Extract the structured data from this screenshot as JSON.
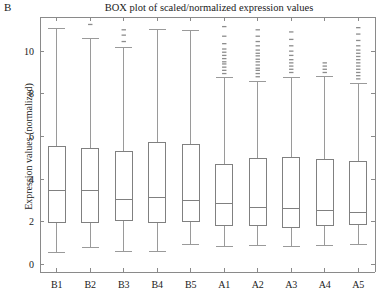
{
  "panel": {
    "label": "B"
  },
  "chart_data": {
    "type": "box",
    "title": "BOX plot of scaled/normalized expression values",
    "xlabel": "",
    "ylabel": "Expression values (normalized)",
    "categories": [
      "B1",
      "B2",
      "B3",
      "B4",
      "B5",
      "A1",
      "A2",
      "A3",
      "A4",
      "A5"
    ],
    "ylim": [
      -0.35,
      11.6
    ],
    "yticks": [
      0,
      2,
      4,
      6,
      8,
      10
    ],
    "ytick_labels": [
      "0",
      "2",
      "4",
      "6",
      "8",
      "10"
    ],
    "grid": false,
    "legend": null,
    "box_color": "#808080",
    "median_color": "#808080",
    "whisker_color": "#9a9a9a",
    "outlier_color": "#8c8c8c",
    "axis_color": "#8a8a8a",
    "boxes": [
      {
        "label": "B1",
        "whisker_low": 0.58,
        "q1": 1.95,
        "median": 3.45,
        "q3": 5.55,
        "whisker_high": 11.05,
        "outliers": []
      },
      {
        "label": "B2",
        "whisker_low": 0.82,
        "q1": 1.98,
        "median": 3.45,
        "q3": 5.42,
        "whisker_high": 10.6,
        "outliers": [
          11.25
        ]
      },
      {
        "label": "B3",
        "whisker_low": 0.6,
        "q1": 2.05,
        "median": 3.05,
        "q3": 5.3,
        "whisker_high": 10.15,
        "outliers": [
          10.45,
          10.75,
          11.0
        ]
      },
      {
        "label": "B4",
        "whisker_low": 0.62,
        "q1": 1.98,
        "median": 3.15,
        "q3": 5.72,
        "whisker_high": 11.0,
        "outliers": []
      },
      {
        "label": "B5",
        "whisker_low": 0.95,
        "q1": 2.02,
        "median": 2.98,
        "q3": 5.62,
        "whisker_high": 10.95,
        "outliers": []
      },
      {
        "label": "A1",
        "whisker_low": 0.85,
        "q1": 1.85,
        "median": 2.85,
        "q3": 4.7,
        "whisker_high": 8.75,
        "outliers": [
          8.95,
          9.1,
          9.25,
          9.4,
          9.5,
          9.65,
          9.8,
          9.95,
          10.1,
          10.35,
          10.7,
          11.15
        ]
      },
      {
        "label": "A2",
        "whisker_low": 0.88,
        "q1": 1.82,
        "median": 2.68,
        "q3": 4.98,
        "whisker_high": 8.6,
        "outliers": [
          8.8,
          8.95,
          9.1,
          9.2,
          9.35,
          9.5,
          9.62,
          9.78,
          9.9,
          10.05,
          10.25,
          10.45,
          10.7,
          11.0
        ]
      },
      {
        "label": "A3",
        "whisker_low": 0.85,
        "q1": 1.75,
        "median": 2.62,
        "q3": 5.02,
        "whisker_high": 8.75,
        "outliers": [
          9.0,
          9.15,
          9.3,
          9.45,
          9.6,
          9.8,
          10.0,
          10.25,
          10.55,
          10.9
        ]
      },
      {
        "label": "A4",
        "whisker_low": 0.9,
        "q1": 1.85,
        "median": 2.52,
        "q3": 4.92,
        "whisker_high": 8.8,
        "outliers": [
          9.0,
          9.15,
          9.3,
          9.45
        ]
      },
      {
        "label": "A5",
        "whisker_low": 0.92,
        "q1": 1.88,
        "median": 2.45,
        "q3": 4.85,
        "whisker_high": 8.5,
        "outliers": [
          8.7,
          8.85,
          9.0,
          9.15,
          9.3,
          9.45,
          9.6,
          9.75,
          9.9,
          10.05,
          10.25,
          10.5,
          10.8,
          11.1
        ]
      }
    ]
  }
}
